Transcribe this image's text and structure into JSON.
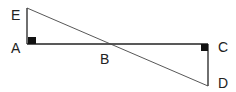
{
  "diagram": {
    "type": "geometry",
    "points": {
      "E": {
        "label": "E",
        "x": 27,
        "y": 8
      },
      "A": {
        "label": "A",
        "x": 27,
        "y": 44
      },
      "B": {
        "label": "B",
        "x": 110,
        "y": 44
      },
      "C": {
        "label": "C",
        "x": 208,
        "y": 44
      },
      "D": {
        "label": "D",
        "x": 208,
        "y": 86
      }
    },
    "segments": [
      [
        "E",
        "A"
      ],
      [
        "A",
        "C"
      ],
      [
        "C",
        "D"
      ],
      [
        "E",
        "D"
      ]
    ],
    "right_angles": [
      "A",
      "C"
    ],
    "line_color": "#222222"
  }
}
